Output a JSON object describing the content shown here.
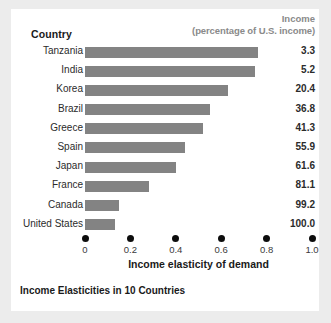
{
  "figure": {
    "country_header": "Country",
    "income_header_line1": "Income",
    "income_header_line2": "(percentage of U.S. income)",
    "caption": "Income Elasticities in 10 Countries",
    "bar_color": "#838383",
    "panel_color": "#ffffff",
    "background_color": "#ececec",
    "tick_dot_color": "#0d0d0d"
  },
  "chart_data": {
    "type": "bar",
    "orientation": "horizontal",
    "title": "Income Elasticities in 10 Countries",
    "xlabel": "Income elasticity of demand",
    "ylabel": "Country",
    "xlim": [
      0,
      1.0
    ],
    "xticks": [
      0,
      0.2,
      0.4,
      0.6,
      0.8,
      1.0
    ],
    "xtick_labels": [
      "0",
      "0.2",
      "0.4",
      "0.6",
      "0.8",
      "1.0"
    ],
    "grid": false,
    "legend": false,
    "value_column_header": "Income (percentage of U.S. income)",
    "categories": [
      "Tanzania",
      "India",
      "Korea",
      "Brazil",
      "Greece",
      "Spain",
      "Japan",
      "France",
      "Canada",
      "United States"
    ],
    "values": [
      0.76,
      0.75,
      0.63,
      0.55,
      0.52,
      0.44,
      0.4,
      0.28,
      0.15,
      0.13
    ],
    "income_percent_of_us": [
      3.3,
      5.2,
      20.4,
      36.8,
      41.3,
      55.9,
      61.6,
      81.1,
      99.2,
      100.0
    ],
    "rows": [
      {
        "country": "Tanzania",
        "elasticity": 0.76,
        "income": "3.3"
      },
      {
        "country": "India",
        "elasticity": 0.75,
        "income": "5.2"
      },
      {
        "country": "Korea",
        "elasticity": 0.63,
        "income": "20.4"
      },
      {
        "country": "Brazil",
        "elasticity": 0.55,
        "income": "36.8"
      },
      {
        "country": "Greece",
        "elasticity": 0.52,
        "income": "41.3"
      },
      {
        "country": "Spain",
        "elasticity": 0.44,
        "income": "55.9"
      },
      {
        "country": "Japan",
        "elasticity": 0.4,
        "income": "61.6"
      },
      {
        "country": "France",
        "elasticity": 0.28,
        "income": "81.1"
      },
      {
        "country": "Canada",
        "elasticity": 0.15,
        "income": "99.2"
      },
      {
        "country": "United States",
        "elasticity": 0.13,
        "income": "100.0"
      }
    ]
  }
}
